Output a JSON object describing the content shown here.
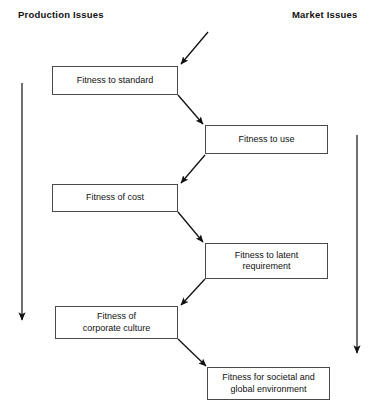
{
  "diagram": {
    "headings": {
      "left": "Production Issues",
      "right": "Market Issues"
    },
    "colors": {
      "box_border": "#4a4a4a",
      "arrow": "#111111",
      "text": "#111111",
      "background": "#ffffff"
    },
    "nodes": [
      {
        "id": "fitness-to-standard",
        "label": "Fitness to standard",
        "side": "left"
      },
      {
        "id": "fitness-to-use",
        "label": "Fitness to use",
        "side": "right"
      },
      {
        "id": "fitness-of-cost",
        "label": "Fitness of cost",
        "side": "left"
      },
      {
        "id": "fitness-to-latent-requirement",
        "label": "Fitness to latent\nrequirement",
        "side": "right"
      },
      {
        "id": "fitness-of-corporate-culture",
        "label": "Fitness of\ncorporate culture",
        "side": "left"
      },
      {
        "id": "fitness-for-societal-and-global-environment",
        "label": "Fitness for societal and\nglobal environment",
        "side": "right"
      }
    ],
    "connectors": [
      {
        "id": "entry-arrow",
        "from": "external",
        "to": "fitness-to-standard"
      },
      {
        "id": "standard-to-use",
        "from": "fitness-to-standard",
        "to": "fitness-to-use"
      },
      {
        "id": "use-to-cost",
        "from": "fitness-to-use",
        "to": "fitness-of-cost"
      },
      {
        "id": "cost-to-latent",
        "from": "fitness-of-cost",
        "to": "fitness-to-latent-requirement"
      },
      {
        "id": "latent-to-culture",
        "from": "fitness-to-latent-requirement",
        "to": "fitness-of-corporate-culture"
      },
      {
        "id": "culture-to-societal",
        "from": "fitness-of-corporate-culture",
        "to": "fitness-for-societal-and-global-environment"
      }
    ],
    "axis_arrows": [
      {
        "id": "production-axis-arrow",
        "direction": "down",
        "side": "left"
      },
      {
        "id": "market-axis-arrow",
        "direction": "down",
        "side": "right"
      }
    ]
  }
}
